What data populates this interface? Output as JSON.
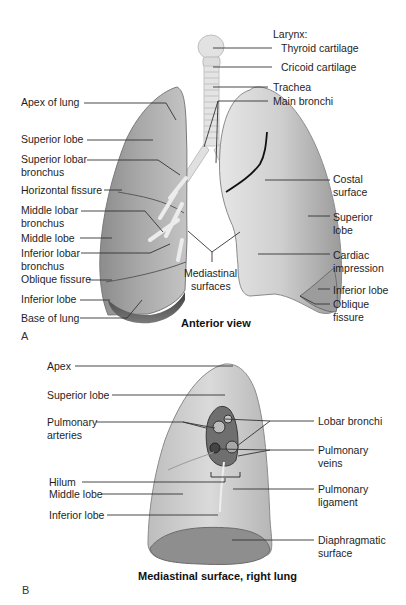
{
  "panel_a": {
    "letter": "A",
    "caption": "Anterior view",
    "labels_left": {
      "apex_of_lung": "Apex of lung",
      "superior_lobe": "Superior lobe",
      "superior_lobar_bronchus_1": "Superior lobar",
      "superior_lobar_bronchus_2": "bronchus",
      "horizontal_fissure": "Horizontal fissure",
      "middle_lobar_bronchus_1": "Middle lobar",
      "middle_lobar_bronchus_2": "bronchus",
      "middle_lobe": "Middle lobe",
      "inferior_lobar_bronchus_1": "Inferior lobar",
      "inferior_lobar_bronchus_2": "bronchus",
      "oblique_fissure": "Oblique fissure",
      "inferior_lobe": "Inferior lobe",
      "base_of_lung": "Base of lung"
    },
    "labels_right": {
      "larynx": "Larynx:",
      "thyroid_cartilage": "Thyroid cartilage",
      "cricoid_cartilage": "Cricoid cartilage",
      "trachea": "Trachea",
      "main_bronchi": "Main bronchi",
      "costal_surface_1": "Costal",
      "costal_surface_2": "surface",
      "superior_lobe_1": "Superior",
      "superior_lobe_2": "lobe",
      "cardiac_impression_1": "Cardiac",
      "cardiac_impression_2": "impression",
      "inferior_lobe": "Inferior lobe",
      "oblique_fissure_1": "Oblique",
      "oblique_fissure_2": "fissure"
    },
    "labels_center": {
      "mediastinal_surfaces_1": "Mediastinal",
      "mediastinal_surfaces_2": "surfaces"
    }
  },
  "panel_b": {
    "letter": "B",
    "caption": "Mediastinal surface, right lung",
    "labels_left": {
      "apex": "Apex",
      "superior_lobe": "Superior lobe",
      "pulmonary_arteries_1": "Pulmonary",
      "pulmonary_arteries_2": "arteries",
      "hilum": "Hilum",
      "middle_lobe": "Middle lobe",
      "inferior_lobe": "Inferior lobe"
    },
    "labels_right": {
      "lobar_bronchi": "Lobar bronchi",
      "pulmonary_veins_1": "Pulmonary",
      "pulmonary_veins_2": "veins",
      "pulmonary_ligament_1": "Pulmonary",
      "pulmonary_ligament_2": "ligament",
      "diaphragmatic_surface_1": "Diaphragmatic",
      "diaphragmatic_surface_2": "surface"
    }
  },
  "colors": {
    "lung_light": "#d8d8d8",
    "lung_mid": "#a9a9a9",
    "lung_dark": "#6e6e6e",
    "leader_line": "#333333",
    "fissure_line": "#111111"
  }
}
